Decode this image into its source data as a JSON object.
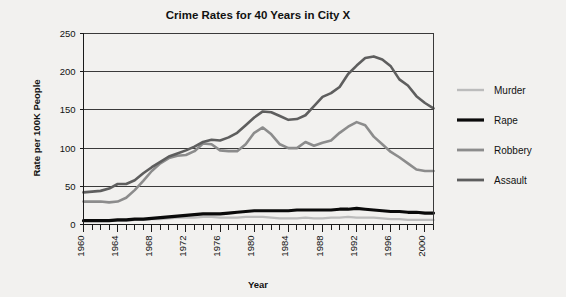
{
  "chart_data": {
    "type": "line",
    "title": "Crime Rates for 40 Years in City X",
    "xlabel": "Year",
    "ylabel": "Rate per 100K People",
    "xlim": [
      1960,
      2001
    ],
    "ylim": [
      0,
      250
    ],
    "yticks": [
      0,
      50,
      100,
      150,
      200,
      250
    ],
    "xticks": [
      1960,
      1964,
      1968,
      1972,
      1976,
      1980,
      1984,
      1988,
      1992,
      1996,
      2000
    ],
    "xtick_minor_step": 1,
    "grid": "horizontal",
    "legend_position": "right",
    "x": [
      1960,
      1961,
      1962,
      1963,
      1964,
      1965,
      1966,
      1967,
      1968,
      1969,
      1970,
      1971,
      1972,
      1973,
      1974,
      1975,
      1976,
      1977,
      1978,
      1979,
      1980,
      1981,
      1982,
      1983,
      1984,
      1985,
      1986,
      1987,
      1988,
      1989,
      1990,
      1991,
      1992,
      1993,
      1994,
      1995,
      1996,
      1997,
      1998,
      1999,
      2000,
      2001
    ],
    "series": [
      {
        "name": "Murder",
        "color": "#bcbcbc",
        "values": [
          5,
          5,
          5,
          5,
          5,
          5,
          6,
          6,
          7,
          7,
          8,
          9,
          9,
          9,
          10,
          10,
          9,
          9,
          9,
          10,
          10,
          10,
          9,
          8,
          8,
          8,
          9,
          8,
          8,
          9,
          9,
          10,
          9,
          9,
          9,
          8,
          7,
          7,
          6,
          6,
          6,
          6
        ]
      },
      {
        "name": "Rape",
        "color": "#0a0a0a",
        "values": [
          5,
          5,
          5,
          5,
          6,
          6,
          7,
          7,
          8,
          9,
          10,
          11,
          12,
          13,
          14,
          14,
          14,
          15,
          16,
          17,
          18,
          18,
          18,
          18,
          18,
          19,
          19,
          19,
          19,
          19,
          20,
          20,
          21,
          20,
          19,
          18,
          17,
          17,
          16,
          16,
          15,
          15
        ]
      },
      {
        "name": "Robbery",
        "color": "#8c8c8c",
        "values": [
          30,
          30,
          30,
          29,
          30,
          35,
          45,
          57,
          70,
          80,
          87,
          90,
          91,
          96,
          106,
          105,
          97,
          96,
          96,
          105,
          120,
          127,
          118,
          105,
          100,
          100,
          108,
          103,
          107,
          110,
          120,
          128,
          134,
          130,
          115,
          105,
          95,
          88,
          80,
          72,
          70,
          70
        ]
      },
      {
        "name": "Assault",
        "color": "#5e5e5e",
        "values": [
          42,
          43,
          44,
          47,
          53,
          53,
          58,
          67,
          75,
          82,
          89,
          93,
          97,
          102,
          108,
          111,
          110,
          114,
          120,
          130,
          140,
          148,
          147,
          142,
          137,
          138,
          143,
          155,
          167,
          172,
          180,
          197,
          208,
          218,
          220,
          216,
          207,
          190,
          182,
          168,
          159,
          152
        ]
      }
    ]
  },
  "legend": {
    "items": [
      {
        "label": "Murder",
        "color": "#bcbcbc",
        "width": 2.4
      },
      {
        "label": "Rape",
        "color": "#0a0a0a",
        "width": 3.2
      },
      {
        "label": "Robbery",
        "color": "#8c8c8c",
        "width": 2.8
      },
      {
        "label": "Assault",
        "color": "#5e5e5e",
        "width": 2.8
      }
    ]
  }
}
